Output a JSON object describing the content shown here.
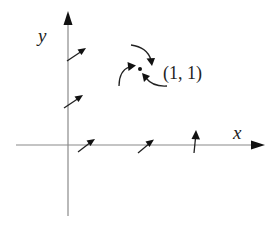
{
  "diagram": {
    "type": "vector-field-sketch",
    "axes": {
      "x_label": "x",
      "y_label": "y"
    },
    "point": {
      "label": "(1, 1)",
      "coords": [
        1,
        1
      ]
    },
    "vectors_description": "Short arrows on the positive x-axis and positive y-axis; three curved arrows circulating around the point (1, 1)",
    "colors": {
      "axis": "#8a8a8a",
      "arrow": "#111111"
    }
  }
}
